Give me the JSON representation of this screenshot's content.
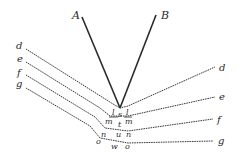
{
  "diagram": {
    "colors": {
      "ink": "#2a2a2a",
      "background": "#ffffff"
    },
    "solid_rays": [
      {
        "label": "A",
        "from": [
          81,
          16
        ],
        "to": [
          120,
          108
        ]
      },
      {
        "label": "B",
        "from": [
          156,
          15
        ],
        "to": [
          120,
          108
        ]
      }
    ],
    "left_labels": [
      "d",
      "e",
      "f",
      "g"
    ],
    "right_labels": [
      "d",
      "e",
      "f",
      "g"
    ],
    "center_labels": {
      "row1": [
        "l",
        "s",
        "l"
      ],
      "row2": [
        "m",
        "t",
        "m"
      ],
      "row3": [
        "n",
        "u",
        "n"
      ],
      "row4": [
        "o",
        "w",
        "o"
      ]
    },
    "top_labels": [
      "A",
      "B"
    ]
  }
}
